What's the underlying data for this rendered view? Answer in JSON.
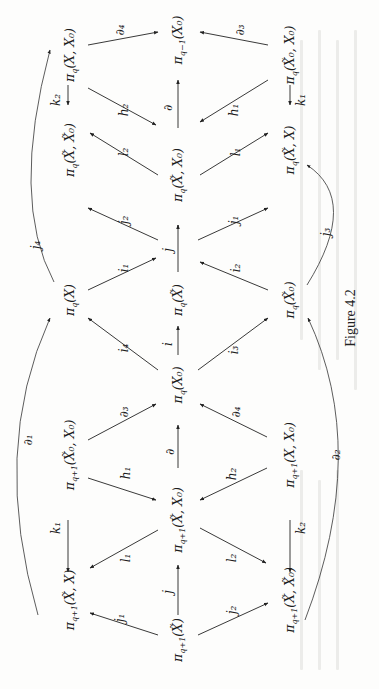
{
  "figure": {
    "caption": "Figure 4.2",
    "orientation": "rotated 90° counter-clockwise",
    "ink_color": "#1c1c1c",
    "paper_color": "#fdfdfc"
  },
  "nodes": [
    {
      "id": "n_pq1_XtX",
      "label": "π_{q+1}(X̃, X)",
      "text": "πq+1(X̃, X)",
      "x": 70,
      "y": 600
    },
    {
      "id": "n_pq1_Xt0X0",
      "label": "π_{q+1}(X̃0, X0)",
      "text": "πq+1(X̃0, X0)",
      "x": 70,
      "y": 455
    },
    {
      "id": "n_pq_X",
      "label": "π_q(X)",
      "text": "πq(X)",
      "x": 70,
      "y": 300
    },
    {
      "id": "n_pq_XtXt0",
      "label": "π_q(X̃, X̃0)",
      "text": "πq(X̃, X̃0)",
      "x": 70,
      "y": 150
    },
    {
      "id": "n_pq_XX0",
      "label": "π_q(X, X0)",
      "text": "πq(X, X0)",
      "x": 70,
      "y": 55
    },
    {
      "id": "n_pq1_Xt",
      "label": "π_{q+1}(X̃)",
      "text": "πq+1(X̃)",
      "x": 178,
      "y": 640
    },
    {
      "id": "n_pq1_XtX0",
      "label": "π_{q+1}(X̃, X0)",
      "text": "πq+1(X̃, X0)",
      "x": 178,
      "y": 525
    },
    {
      "id": "n_pq_X0",
      "label": "π_q(X0)",
      "text": "πq(X0)",
      "x": 178,
      "y": 385
    },
    {
      "id": "n_pq_Xt",
      "label": "π_q(X̃)",
      "text": "πq(X̃)",
      "x": 178,
      "y": 300
    },
    {
      "id": "n_pq_XtX0",
      "label": "π_q(X̃, X0)",
      "text": "πq(X̃, X0)",
      "x": 178,
      "y": 180
    },
    {
      "id": "n_pqm1_X0",
      "label": "π_{q−1}(X0)",
      "text": "πq−1(X0)",
      "x": 178,
      "y": 40
    },
    {
      "id": "n_pq1_XtXt0",
      "label": "π_{q+1}(X̃, X̃0)",
      "text": "πq+1(X̃, X̃0)",
      "x": 290,
      "y": 600
    },
    {
      "id": "n_pq1_XX0",
      "label": "π_{q+1}(X, X0)",
      "text": "πq+1(X, X0)",
      "x": 290,
      "y": 455
    },
    {
      "id": "n_pq_Xt0",
      "label": "π_q(X̃0)",
      "text": "πq(X̃0)",
      "x": 290,
      "y": 300
    },
    {
      "id": "n_pq_XtX",
      "label": "π_q(X̃, X)",
      "text": "πq(X̃, X)",
      "x": 290,
      "y": 150
    },
    {
      "id": "n_pq_Xt0X0",
      "label": "π_q(X̃0, X0)",
      "text": "πq(X̃0, X0)",
      "x": 290,
      "y": 55
    }
  ],
  "edges": [
    {
      "from": "n_pq1_Xt",
      "to": "n_pq1_XtX",
      "label": "j1"
    },
    {
      "from": "n_pq1_Xt",
      "to": "n_pq1_XtX0",
      "label": "j"
    },
    {
      "from": "n_pq1_Xt",
      "to": "n_pq1_XtXt0",
      "label": "j2"
    },
    {
      "from": "n_pq1_XtX0",
      "to": "n_pq1_XtX",
      "label": "l1"
    },
    {
      "from": "n_pq1_XtX0",
      "to": "n_pq1_XtXt0",
      "label": "l2"
    },
    {
      "from": "n_pq1_Xt0X0",
      "to": "n_pq1_XtX",
      "label": "k1"
    },
    {
      "from": "n_pq1_XX0",
      "to": "n_pq1_XtXt0",
      "label": "k2"
    },
    {
      "from": "n_pq1_Xt0X0",
      "to": "n_pq1_XtX0",
      "label": "h1"
    },
    {
      "from": "n_pq1_XX0",
      "to": "n_pq1_XtX0",
      "label": "h2"
    },
    {
      "from": "n_pq1_XtX0",
      "to": "n_pq_X0",
      "label": "∂"
    },
    {
      "from": "n_pq1_Xt0X0",
      "to": "n_pq_X0",
      "label": "∂3"
    },
    {
      "from": "n_pq1_XX0",
      "to": "n_pq_X0",
      "label": "∂4"
    },
    {
      "from": "n_pq_X0",
      "to": "n_pq_X",
      "label": "i4"
    },
    {
      "from": "n_pq_X0",
      "to": "n_pq_Xt",
      "label": "i"
    },
    {
      "from": "n_pq_X0",
      "to": "n_pq_Xt0",
      "label": "i3"
    },
    {
      "from": "n_pq_X",
      "to": "n_pq_Xt",
      "label": "i1"
    },
    {
      "from": "n_pq_Xt0",
      "to": "n_pq_Xt",
      "label": "i2"
    },
    {
      "from": "n_pq_Xt",
      "to": "n_pq_XtXt0",
      "label": "j2"
    },
    {
      "from": "n_pq_Xt",
      "to": "n_pq_XtX0",
      "label": "j"
    },
    {
      "from": "n_pq_Xt",
      "to": "n_pq_XtX",
      "label": "j1"
    },
    {
      "from": "n_pq_XtX0",
      "to": "n_pq_XtXt0",
      "label": "l2"
    },
    {
      "from": "n_pq_XtX0",
      "to": "n_pq_XtX",
      "label": "l1"
    },
    {
      "from": "n_pq_XX0",
      "to": "n_pq_XtXt0",
      "label": "k2"
    },
    {
      "from": "n_pq_Xt0X0",
      "to": "n_pq_XtX",
      "label": "k1"
    },
    {
      "from": "n_pq_XX0",
      "to": "n_pq_XtX0",
      "label": "h2"
    },
    {
      "from": "n_pq_Xt0X0",
      "to": "n_pq_XtX0",
      "label": "h1"
    },
    {
      "from": "n_pq_XtX0",
      "to": "n_pqm1_X0",
      "label": "∂"
    },
    {
      "from": "n_pq_XX0",
      "to": "n_pqm1_X0",
      "label": "∂4"
    },
    {
      "from": "n_pq_Xt0X0",
      "to": "n_pqm1_X0",
      "label": "∂3"
    }
  ],
  "arcs": [
    {
      "from": "n_pq1_XtX",
      "to": "n_pq_X",
      "label": "∂1",
      "side": "left"
    },
    {
      "from": "n_pq_XtXt0",
      "to": "n_pq_X",
      "label": "j4",
      "side": "left"
    },
    {
      "from": "n_pq1_XtXt0",
      "to": "n_pq_Xt0",
      "label": "∂2",
      "side": "right"
    },
    {
      "from": "n_pq_XtX",
      "to": "n_pq_Xt0",
      "label": "j3",
      "side": "right"
    }
  ],
  "labels": {
    "j1_bottom": "j₁",
    "j_bottom": "j",
    "j2_bottom": "j₂",
    "l1_bottom": "l₁",
    "l2_bottom": "l₂",
    "k1_bottom": "k₁",
    "k2_bottom": "k₂",
    "h1_bottom": "h₁",
    "h2_bottom": "h₂",
    "d_mid": "∂",
    "d3_mid": "∂₃",
    "d4_mid": "∂₄",
    "i4": "i₄",
    "i": "i",
    "i3": "i₃",
    "i1": "i₁",
    "i2": "i₂",
    "j2_top": "j₂",
    "j_top": "j",
    "j1_top": "j₁",
    "l2_top": "l₂",
    "l1_top": "l₁",
    "k2_top": "k₂",
    "k1_top": "k₁",
    "h2_top": "h₂",
    "h1_top": "h₁",
    "d_top": "∂",
    "d4_top": "∂₄",
    "d3_top": "∂₃",
    "d1_arc": "∂₁",
    "j4_arc": "j₄",
    "d2_arc": "∂₂",
    "j3_arc": "j₃"
  },
  "node_text": {
    "pq1_XtX": "π",
    "pq1_XtX_sub": "q+1",
    "pq1_XtX_arg": "(X̃, X)",
    "pq1_Xt0X0_sub": "q+1",
    "pq1_Xt0X0_arg": "(X̃₀, X₀)",
    "pq_X_sub": "q",
    "pq_X_arg": "(X)",
    "pq_XtXt0_sub": "q",
    "pq_XtXt0_arg": "(X̃, X̃₀)",
    "pq_XX0_sub": "q",
    "pq_XX0_arg": "(X, X₀)",
    "pq1_Xt_sub": "q+1",
    "pq1_Xt_arg": "(X̃)",
    "pq1_XtX0_sub": "q+1",
    "pq1_XtX0_arg": "(X̃, X₀)",
    "pq_X0_sub": "q",
    "pq_X0_arg": "(X₀)",
    "pq_Xt_sub": "q",
    "pq_Xt_arg": "(X̃)",
    "pq_XtX0_sub": "q",
    "pq_XtX0_arg": "(X̃, X₀)",
    "pqm1_X0_sub": "q−1",
    "pqm1_X0_arg": "(X₀)",
    "pq1_XtXt0_sub": "q+1",
    "pq1_XtXt0_arg": "(X̃, X̃₀)",
    "pq1_XX0_sub": "q+1",
    "pq1_XX0_arg": "(X, X₀)",
    "pq_Xt0_sub": "q",
    "pq_Xt0_arg": "(X̃₀)",
    "pq_XtX_sub": "q",
    "pq_XtX_arg": "(X̃, X)",
    "pq_Xt0X0_sub": "q",
    "pq_Xt0X0_arg": "(X̃₀, X₀)",
    "pi": "π"
  }
}
